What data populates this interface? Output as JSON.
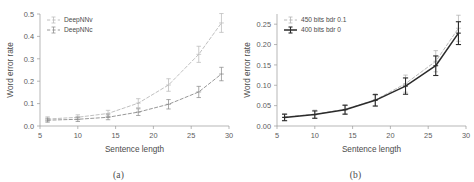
{
  "figure": {
    "background_color": "#ffffff",
    "panel_count": 2
  },
  "panels": [
    {
      "caption": "(a)",
      "xlabel": "Sentence length",
      "ylabel": "Word error rate"
    },
    {
      "caption": "(b)",
      "xlabel": "Sentence length",
      "ylabel": "Word error rate"
    }
  ],
  "chart_data": [
    {
      "type": "line",
      "title": "",
      "subcaption": "(a)",
      "xlabel": "Sentence length",
      "ylabel": "Word error rate",
      "xlim": [
        5,
        30
      ],
      "ylim": [
        0.0,
        0.5
      ],
      "xticks": [
        5,
        10,
        15,
        20,
        25,
        30
      ],
      "xticklabels": [
        "5",
        "10",
        "15",
        "20",
        "25",
        "30"
      ],
      "yticks": [
        0.0,
        0.1,
        0.2,
        0.3,
        0.4,
        0.5
      ],
      "yticklabels": [
        "0.0",
        "0.1",
        "0.2",
        "0.3",
        "0.4",
        "0.5"
      ],
      "grid": false,
      "legend_position": "upper left",
      "x": [
        6,
        10,
        14,
        18,
        22,
        26,
        29
      ],
      "series": [
        {
          "name": "DeepNNv",
          "color": "#b9b9b9",
          "linestyle": "dashed",
          "marker": "plus",
          "values": [
            0.031,
            0.039,
            0.056,
            0.102,
            0.183,
            0.32,
            0.46
          ],
          "yerr": [
            0.01,
            0.011,
            0.014,
            0.02,
            0.028,
            0.036,
            0.042
          ]
        },
        {
          "name": "DeepNNc",
          "color": "#8c8c8c",
          "linestyle": "dashed",
          "marker": "plus",
          "values": [
            0.026,
            0.03,
            0.039,
            0.062,
            0.097,
            0.152,
            0.232
          ],
          "yerr": [
            0.009,
            0.01,
            0.011,
            0.015,
            0.021,
            0.025,
            0.03
          ]
        }
      ]
    },
    {
      "type": "line",
      "title": "",
      "subcaption": "(b)",
      "xlabel": "Sentence length",
      "ylabel": "Word error rate",
      "xlim": [
        5,
        30
      ],
      "ylim": [
        0.0,
        0.275
      ],
      "xticks": [
        5,
        10,
        15,
        20,
        25,
        30
      ],
      "xticklabels": [
        "5",
        "10",
        "15",
        "20",
        "25",
        "30"
      ],
      "yticks": [
        0.0,
        0.05,
        0.1,
        0.15,
        0.2,
        0.25
      ],
      "yticklabels": [
        "0.00",
        "0.05",
        "0.10",
        "0.15",
        "0.20",
        "0.25"
      ],
      "grid": false,
      "legend_position": "upper left",
      "x": [
        6,
        10,
        14,
        18,
        22,
        26,
        29
      ],
      "series": [
        {
          "name": "450 bits bdr 0.1",
          "color": "#b0b0b0",
          "linestyle": "dashed",
          "marker": "plus",
          "values": [
            0.022,
            0.029,
            0.041,
            0.064,
            0.104,
            0.159,
            0.24
          ],
          "yerr": [
            0.008,
            0.01,
            0.011,
            0.015,
            0.021,
            0.026,
            0.032
          ]
        },
        {
          "name": "400 bits bdr 0",
          "color": "#2b2b2b",
          "linestyle": "solid",
          "marker": "plus",
          "values": [
            0.021,
            0.028,
            0.04,
            0.063,
            0.098,
            0.148,
            0.228
          ],
          "yerr": [
            0.008,
            0.009,
            0.011,
            0.014,
            0.02,
            0.024,
            0.028
          ]
        }
      ]
    }
  ]
}
